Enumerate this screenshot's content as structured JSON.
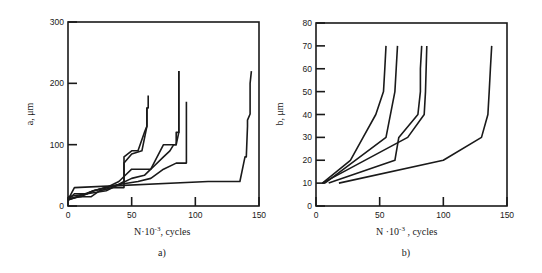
{
  "chart_data": [
    {
      "type": "line",
      "panel_label": "a)",
      "title": "",
      "xlabel": "N·10⁻³, cycles",
      "ylabel": "a, μm",
      "xlim": [
        0,
        150
      ],
      "ylim": [
        0,
        300
      ],
      "xticks": [
        "0",
        "50",
        "100",
        "150"
      ],
      "yticks": [
        "0",
        "100",
        "200",
        "300"
      ],
      "grid": false,
      "legend": null,
      "series": [
        {
          "name": "specimen 1",
          "x": [
            0,
            5,
            15,
            20,
            30,
            40,
            44,
            44,
            50,
            55,
            60,
            62,
            62,
            63,
            63
          ],
          "y": [
            10,
            20,
            20,
            25,
            30,
            35,
            40,
            80,
            90,
            90,
            120,
            130,
            160,
            160,
            180
          ]
        },
        {
          "name": "specimen 2",
          "x": [
            0,
            8,
            18,
            25,
            35,
            44,
            44,
            50,
            58,
            62,
            62
          ],
          "y": [
            10,
            15,
            15,
            25,
            30,
            30,
            70,
            85,
            90,
            130,
            160
          ]
        },
        {
          "name": "specimen 3",
          "x": [
            0,
            10,
            20,
            30,
            40,
            45,
            50,
            65,
            75,
            80,
            83,
            85,
            85,
            87,
            87
          ],
          "y": [
            12,
            15,
            25,
            30,
            40,
            50,
            60,
            60,
            80,
            90,
            100,
            100,
            120,
            120,
            220
          ]
        },
        {
          "name": "specimen 4",
          "x": [
            0,
            15,
            30,
            40,
            50,
            60,
            65,
            75,
            85,
            87,
            87
          ],
          "y": [
            15,
            20,
            25,
            35,
            45,
            50,
            60,
            100,
            100,
            120,
            220
          ]
        },
        {
          "name": "specimen 5",
          "x": [
            0,
            20,
            40,
            55,
            65,
            75,
            85,
            93,
            93
          ],
          "y": [
            10,
            25,
            35,
            40,
            45,
            60,
            70,
            70,
            170
          ]
        },
        {
          "name": "specimen 6",
          "x": [
            0,
            5,
            110,
            135,
            138,
            139,
            140,
            141,
            141,
            143,
            143,
            144
          ],
          "y": [
            10,
            30,
            40,
            40,
            70,
            80,
            80,
            130,
            140,
            150,
            200,
            220
          ]
        }
      ]
    },
    {
      "type": "line",
      "panel_label": "b)",
      "title": "",
      "xlabel": "N ·10⁻³ ,  cycles",
      "ylabel": "b, μm",
      "xlim": [
        0,
        150
      ],
      "ylim": [
        0,
        80
      ],
      "xticks": [
        "0",
        "50",
        "100",
        "150"
      ],
      "yticks": [
        "0",
        "10",
        "20",
        "30",
        "40",
        "50",
        "60",
        "70",
        "80"
      ],
      "grid": false,
      "legend": null,
      "series": [
        {
          "name": "specimen 1",
          "x": [
            5,
            27,
            37,
            47,
            53,
            54,
            55
          ],
          "y": [
            10,
            20,
            30,
            40,
            50,
            60,
            70
          ]
        },
        {
          "name": "specimen 2",
          "x": [
            7,
            55,
            62,
            63,
            64
          ],
          "y": [
            10,
            30,
            50,
            60,
            70
          ]
        },
        {
          "name": "specimen 3",
          "x": [
            10,
            62,
            65,
            80,
            82,
            82,
            83
          ],
          "y": [
            10,
            20,
            30,
            40,
            50,
            60,
            70
          ]
        },
        {
          "name": "specimen 4",
          "x": [
            5,
            72,
            85,
            86,
            87
          ],
          "y": [
            10,
            30,
            40,
            50,
            70
          ]
        },
        {
          "name": "specimen 5",
          "x": [
            18,
            100,
            130,
            135,
            136,
            137,
            138
          ],
          "y": [
            10,
            20,
            30,
            40,
            50,
            60,
            70
          ]
        }
      ]
    }
  ],
  "panels": {
    "a": {
      "caption": "a)",
      "ylabel": "a, μm",
      "xlabel_main": "N·10",
      "xlabel_exp": "-3",
      "xlabel_tail": ", cycles",
      "xticks": [
        "0",
        "50",
        "100",
        "150"
      ],
      "yticks": [
        "0",
        "100",
        "200",
        "300"
      ]
    },
    "b": {
      "caption": "b)",
      "ylabel": "b, μm",
      "xlabel_main": "N ·10",
      "xlabel_exp": "-3",
      "xlabel_tail": " ,  cycles",
      "xticks": [
        "0",
        "50",
        "100",
        "150"
      ],
      "yticks": [
        "0",
        "10",
        "20",
        "30",
        "40",
        "50",
        "60",
        "70",
        "80"
      ]
    }
  },
  "colors": {
    "ink": "#1a1a1a",
    "background": "#ffffff"
  }
}
